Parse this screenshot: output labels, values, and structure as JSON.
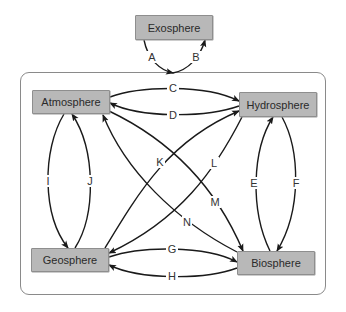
{
  "diagram": {
    "type": "cycle-interaction-diagram",
    "nodes": [
      {
        "id": "exosphere",
        "label": "Exosphere",
        "x": 135,
        "y": 15,
        "w": 78,
        "h": 25
      },
      {
        "id": "atmosphere",
        "label": "Atmosphere",
        "x": 32,
        "y": 90,
        "w": 78,
        "h": 24
      },
      {
        "id": "hydrosphere",
        "label": "Hydrosphere",
        "x": 239,
        "y": 92,
        "w": 78,
        "h": 25
      },
      {
        "id": "geosphere",
        "label": "Geosphere",
        "x": 31,
        "y": 248,
        "w": 78,
        "h": 24
      },
      {
        "id": "biosphere",
        "label": "Biosphere",
        "x": 237,
        "y": 251,
        "w": 78,
        "h": 24
      }
    ],
    "edges": [
      {
        "label": "A",
        "from": "exosphere",
        "to": "earth-system",
        "lx": 152,
        "ly": 57
      },
      {
        "label": "B",
        "from": "earth-system",
        "to": "exosphere",
        "lx": 196,
        "ly": 57
      },
      {
        "label": "C",
        "from": "atmosphere",
        "to": "hydrosphere",
        "lx": 173,
        "ly": 88
      },
      {
        "label": "D",
        "from": "hydrosphere",
        "to": "atmosphere",
        "lx": 173,
        "ly": 115
      },
      {
        "label": "E",
        "from": "biosphere",
        "to": "hydrosphere",
        "lx": 254,
        "ly": 183
      },
      {
        "label": "F",
        "from": "hydrosphere",
        "to": "biosphere",
        "lx": 296,
        "ly": 183
      },
      {
        "label": "G",
        "from": "geosphere",
        "to": "biosphere",
        "lx": 172,
        "ly": 249
      },
      {
        "label": "H",
        "from": "biosphere",
        "to": "geosphere",
        "lx": 172,
        "ly": 276
      },
      {
        "label": "I",
        "from": "atmosphere",
        "to": "geosphere",
        "lx": 48,
        "ly": 181
      },
      {
        "label": "J",
        "from": "geosphere",
        "to": "atmosphere",
        "lx": 90,
        "ly": 181
      },
      {
        "label": "K",
        "from": "geosphere",
        "to": "hydrosphere",
        "lx": 160,
        "ly": 162
      },
      {
        "label": "L",
        "from": "hydrosphere",
        "to": "geosphere",
        "lx": 214,
        "ly": 163
      },
      {
        "label": "M",
        "from": "atmosphere",
        "to": "biosphere",
        "lx": 215,
        "ly": 202
      },
      {
        "label": "N",
        "from": "biosphere",
        "to": "atmosphere",
        "lx": 187,
        "ly": 222
      }
    ]
  }
}
